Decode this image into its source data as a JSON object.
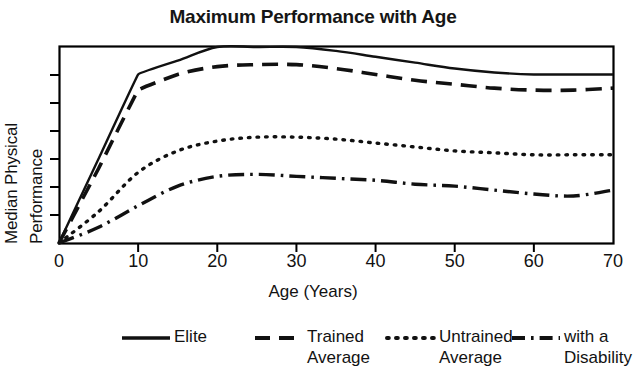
{
  "title": "Maximum Performance with Age",
  "axes": {
    "xlabel": "Age (Years)",
    "ylabel_line1": "Median Physical",
    "ylabel_line2": "Performance",
    "xticks": [
      "0",
      "10",
      "20",
      "30",
      "40",
      "50",
      "60",
      "70"
    ]
  },
  "legend": {
    "items": [
      {
        "label": "Elite",
        "style": "solid"
      },
      {
        "label": "Trained\nAverage",
        "style": "dashed"
      },
      {
        "label": "Untrained\nAverage",
        "style": "dotted"
      },
      {
        "label": "with a\nDisability",
        "style": "dashdot"
      }
    ]
  },
  "colors": {
    "ink": "#121212",
    "frame": "#000000",
    "background": "#ffffff"
  },
  "chart_data": {
    "type": "line",
    "title": "Maximum Performance with Age",
    "xlabel": "Age (Years)",
    "ylabel": "Median Physical Performance",
    "xlim": [
      0,
      70
    ],
    "ylim": [
      0,
      100
    ],
    "grid": false,
    "xticks": [
      0,
      10,
      20,
      30,
      40,
      50,
      60,
      70
    ],
    "yticks": [],
    "ytick_labels": [],
    "legend_position": "below",
    "x": [
      0,
      5,
      10,
      15,
      20,
      25,
      30,
      35,
      40,
      45,
      50,
      55,
      60,
      65,
      70
    ],
    "series": [
      {
        "name": "Elite",
        "linestyle": "solid",
        "values": [
          0,
          43,
          86,
          93,
          100,
          100,
          100,
          98,
          95,
          92,
          89,
          87,
          86,
          86,
          86
        ]
      },
      {
        "name": "Trained Average",
        "linestyle": "dashed",
        "values": [
          0,
          38,
          78,
          86,
          90,
          91,
          91,
          89,
          86,
          83,
          81,
          79,
          78,
          78,
          79
        ]
      },
      {
        "name": "Untrained Average",
        "linestyle": "dotted",
        "values": [
          0,
          16,
          36,
          47,
          52,
          54,
          54,
          53,
          51,
          49,
          47,
          46,
          45,
          45,
          45
        ]
      },
      {
        "name": "with a Disability",
        "linestyle": "dashdot",
        "values": [
          0,
          8,
          19,
          29,
          34,
          35,
          34,
          33,
          32,
          30,
          29,
          27,
          25,
          24,
          27
        ]
      }
    ]
  }
}
